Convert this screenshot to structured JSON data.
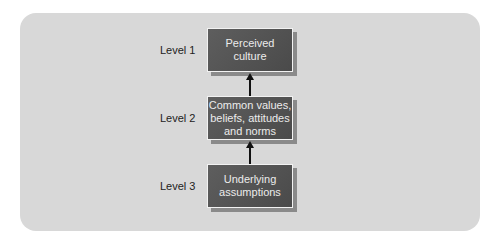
{
  "levels": [
    {
      "label": "Level 1",
      "text": "Perceived culture"
    },
    {
      "label": "Level 2",
      "text": "Common values, beliefs, attitudes and norms"
    },
    {
      "label": "Level 3",
      "text": "Underlying assumptions"
    }
  ]
}
